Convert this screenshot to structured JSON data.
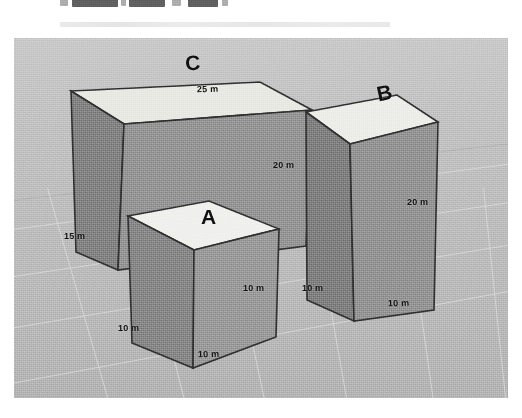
{
  "figure": {
    "kind": "3d-rectangular-prisms-diagram",
    "caption_fragment_top": "",
    "ground": {
      "grid": true,
      "color": "#c2c2c2"
    },
    "palette": {
      "top_face": "#ededea",
      "left_face": "#8f8f8f",
      "right_face": "#a0a0a0",
      "outline": "#2b2b2b",
      "label_color": "#101010",
      "background": "#ffffff"
    },
    "boxes": [
      {
        "id": "box-a",
        "label": "A",
        "shape": "cube",
        "dimensions": [
          {
            "name": "width-front",
            "text": "10 m",
            "value": 10,
            "unit": "m"
          },
          {
            "name": "depth-left",
            "text": "10 m",
            "value": 10,
            "unit": "m"
          },
          {
            "name": "height-right",
            "text": "10 m",
            "value": 10,
            "unit": "m"
          }
        ]
      },
      {
        "id": "box-b",
        "label": "B",
        "shape": "tall-prism",
        "dimensions": [
          {
            "name": "height-right",
            "text": "20 m",
            "value": 20,
            "unit": "m"
          },
          {
            "name": "depth-left",
            "text": "10 m",
            "value": 10,
            "unit": "m"
          },
          {
            "name": "width-front",
            "text": "10 m",
            "value": 10,
            "unit": "m"
          }
        ]
      },
      {
        "id": "box-c",
        "label": "C",
        "shape": "wide-prism",
        "dimensions": [
          {
            "name": "width-top",
            "text": "25 m",
            "value": 25,
            "unit": "m"
          },
          {
            "name": "height-right",
            "text": "20 m",
            "value": 20,
            "unit": "m"
          },
          {
            "name": "depth-left",
            "text": "15 m",
            "value": 15,
            "unit": "m"
          }
        ]
      }
    ]
  }
}
